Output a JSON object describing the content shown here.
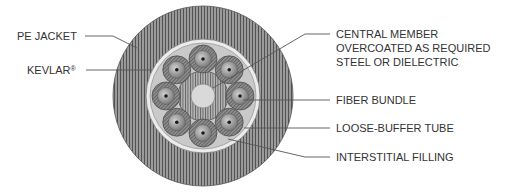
{
  "diagram": {
    "colors": {
      "jacket": "#8a8a8a",
      "jacket_hatch": "#555555",
      "kevlar_ring": "#e6e6e6",
      "filling": "#c8c8c8",
      "tube": "#7a7a7a",
      "tube_inner": "#a0a0a0",
      "fiber_core": "#222222",
      "central_core": "#d9d9d9",
      "leader": "#555555",
      "text": "#333333"
    },
    "labels_left": [
      {
        "id": "pe-jacket",
        "text": "PE JACKET"
      },
      {
        "id": "kevlar",
        "text": "KEVLAR",
        "mark": "®"
      }
    ],
    "labels_right": [
      {
        "id": "central-member",
        "lines": [
          "CENTRAL MEMBER",
          "OVERCOATED AS REQUIRED",
          "STEEL OR DIELECTRIC"
        ]
      },
      {
        "id": "fiber-bundle",
        "text": "FIBER BUNDLE"
      },
      {
        "id": "loose-buffer-tube",
        "text": "LOOSE-BUFFER TUBE"
      },
      {
        "id": "interstitial-filling",
        "text": "INTERSTITIAL FILLING"
      }
    ]
  }
}
